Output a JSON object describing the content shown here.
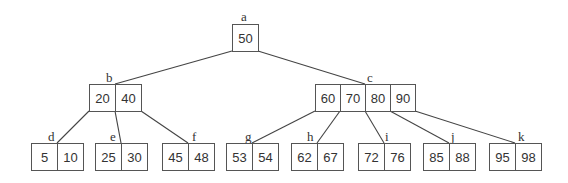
{
  "diagram": {
    "type": "B-tree",
    "colors": {
      "line": "#444444",
      "border": "#555555",
      "text": "#333333",
      "background": "#ffffff"
    },
    "nodes": [
      {
        "id": "a",
        "label": "a",
        "keys": [
          "50"
        ],
        "x": 232,
        "y": 24,
        "cellw": 26,
        "h": 28,
        "lx": 241,
        "ly": 10
      },
      {
        "id": "b",
        "label": "b",
        "keys": [
          "20",
          "40"
        ],
        "x": 89,
        "y": 84,
        "cellw": 26,
        "h": 28,
        "lx": 106,
        "ly": 71
      },
      {
        "id": "c",
        "label": "c",
        "keys": [
          "60",
          "70",
          "80",
          "90"
        ],
        "x": 315,
        "y": 84,
        "cellw": 25,
        "h": 28,
        "lx": 367,
        "ly": 71
      },
      {
        "id": "d",
        "label": "d",
        "keys": [
          "5",
          "10"
        ],
        "x": 31,
        "y": 143,
        "cellw": 26,
        "h": 28,
        "lx": 48,
        "ly": 130
      },
      {
        "id": "e",
        "label": "e",
        "keys": [
          "25",
          "30"
        ],
        "x": 95,
        "y": 143,
        "cellw": 26,
        "h": 28,
        "lx": 110,
        "ly": 130
      },
      {
        "id": "f",
        "label": "f",
        "keys": [
          "45",
          "48"
        ],
        "x": 162,
        "y": 143,
        "cellw": 26,
        "h": 28,
        "lx": 192,
        "ly": 130
      },
      {
        "id": "g",
        "label": "g",
        "keys": [
          "53",
          "54"
        ],
        "x": 226,
        "y": 143,
        "cellw": 26,
        "h": 28,
        "lx": 245,
        "ly": 130
      },
      {
        "id": "h",
        "label": "h",
        "keys": [
          "62",
          "67"
        ],
        "x": 291,
        "y": 143,
        "cellw": 26,
        "h": 28,
        "lx": 307,
        "ly": 130
      },
      {
        "id": "i",
        "label": "i",
        "keys": [
          "72",
          "76"
        ],
        "x": 358,
        "y": 143,
        "cellw": 26,
        "h": 28,
        "lx": 385,
        "ly": 130
      },
      {
        "id": "j",
        "label": "j",
        "keys": [
          "85",
          "88"
        ],
        "x": 423,
        "y": 143,
        "cellw": 26,
        "h": 28,
        "lx": 451,
        "ly": 130
      },
      {
        "id": "k",
        "label": "k",
        "keys": [
          "95",
          "98"
        ],
        "x": 489,
        "y": 143,
        "cellw": 26,
        "h": 28,
        "lx": 518,
        "ly": 130
      }
    ],
    "edges": [
      {
        "from": "a",
        "to": "b",
        "x1": 232,
        "y1": 51,
        "x2": 115,
        "y2": 84
      },
      {
        "from": "a",
        "to": "c",
        "x1": 258,
        "y1": 51,
        "x2": 365,
        "y2": 84
      },
      {
        "from": "b",
        "to": "d",
        "x1": 89,
        "y1": 111,
        "x2": 57,
        "y2": 143
      },
      {
        "from": "b",
        "to": "e",
        "x1": 115,
        "y1": 111,
        "x2": 121,
        "y2": 143
      },
      {
        "from": "b",
        "to": "f",
        "x1": 141,
        "y1": 111,
        "x2": 188,
        "y2": 143
      },
      {
        "from": "c",
        "to": "g",
        "x1": 315,
        "y1": 111,
        "x2": 252,
        "y2": 143
      },
      {
        "from": "c",
        "to": "h",
        "x1": 340,
        "y1": 111,
        "x2": 317,
        "y2": 143
      },
      {
        "from": "c",
        "to": "i",
        "x1": 365,
        "y1": 111,
        "x2": 384,
        "y2": 143
      },
      {
        "from": "c",
        "to": "j",
        "x1": 390,
        "y1": 111,
        "x2": 449,
        "y2": 143
      },
      {
        "from": "c",
        "to": "k",
        "x1": 415,
        "y1": 111,
        "x2": 515,
        "y2": 143
      }
    ]
  }
}
